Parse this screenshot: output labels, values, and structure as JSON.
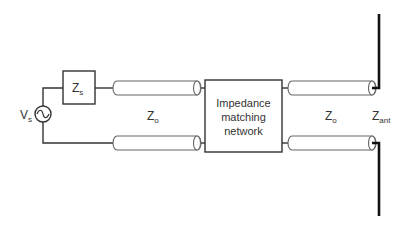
{
  "diagram": {
    "source": {
      "label": "V",
      "subscript": "s",
      "icon": "ac-source-icon"
    },
    "source_impedance": {
      "label": "Z",
      "subscript": "s"
    },
    "left_line": {
      "label": "Z",
      "subscript": "o"
    },
    "network": {
      "lines": [
        "Impedance",
        "matching",
        "network"
      ]
    },
    "right_line": {
      "label": "Z",
      "subscript": "o"
    },
    "antenna": {
      "label": "Z",
      "subscript": "ant"
    },
    "colors": {
      "stroke": "#333333",
      "antenna": "#111111",
      "background": "#ffffff"
    }
  }
}
